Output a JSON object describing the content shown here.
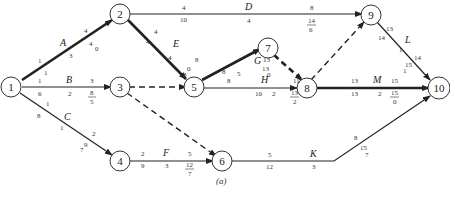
{
  "diagram": {
    "type": "activity-on-arrow network (CPM)",
    "caption": "(a)",
    "nodes": [
      {
        "id": "1",
        "label": "1"
      },
      {
        "id": "2",
        "label": "2"
      },
      {
        "id": "3",
        "label": "3"
      },
      {
        "id": "4",
        "label": "4"
      },
      {
        "id": "5",
        "label": "5"
      },
      {
        "id": "6",
        "label": "6"
      },
      {
        "id": "7",
        "label": "7"
      },
      {
        "id": "8",
        "label": "8"
      },
      {
        "id": "9",
        "label": "9"
      },
      {
        "id": "10",
        "label": "10"
      }
    ],
    "activities": [
      {
        "name": "A",
        "from": "1",
        "to": "2",
        "critical": true,
        "es": "1",
        "ls": "1",
        "dur": "3",
        "ef": "4",
        "tf_num": "4",
        "tf_den": "0"
      },
      {
        "name": "B",
        "from": "1",
        "to": "3",
        "critical": false,
        "es": "1",
        "ls": "6",
        "dur": "2",
        "ef": "3",
        "tf_num": "8",
        "tf_den": "5"
      },
      {
        "name": "C",
        "from": "1",
        "to": "4",
        "critical": false,
        "es": "1",
        "ls": "8",
        "dur": "1",
        "ef": "2",
        "tf_num": "9",
        "tf_den": "7"
      },
      {
        "name": "D",
        "from": "2",
        "to": "9",
        "critical": false,
        "es": "4",
        "ls": "10",
        "dur": "4",
        "ef": "8",
        "tf_num": "14",
        "tf_den": "6"
      },
      {
        "name": "E",
        "from": "2",
        "to": "5",
        "critical": true,
        "es": "4",
        "ls": "4",
        "dur": "4",
        "ef": "8",
        "tf_num": "8",
        "tf_den": "0"
      },
      {
        "name": "F",
        "from": "4",
        "to": "6",
        "critical": false,
        "es": "2",
        "ls": "9",
        "dur": "3",
        "ef": "5",
        "tf_num": "12",
        "tf_den": "7"
      },
      {
        "name": "G",
        "from": "5",
        "to": "7",
        "critical": true,
        "es": "8",
        "ls": "8",
        "dur": "5",
        "ef": "13",
        "tf_num": "13",
        "tf_den": "0"
      },
      {
        "name": "H",
        "from": "5",
        "to": "8",
        "critical": false,
        "es": "8",
        "ls": "10",
        "dur": "2",
        "ef": "11",
        "tf_num": "13",
        "tf_den": "2"
      },
      {
        "name": "K",
        "from": "6",
        "to": "10",
        "critical": false,
        "es": "5",
        "ls": "12",
        "dur": "3",
        "ef": "8",
        "tf_num": "15",
        "tf_den": "7"
      },
      {
        "name": "L",
        "from": "9",
        "to": "10",
        "critical": false,
        "es": "13",
        "ls": "14",
        "dur": "1",
        "ef": "14",
        "tf_num": "15",
        "tf_den": "1"
      },
      {
        "name": "M",
        "from": "8",
        "to": "10",
        "critical": true,
        "es": "13",
        "ls": "13",
        "dur": "2",
        "ef": "15",
        "tf_num": "15",
        "tf_den": "0"
      }
    ],
    "dummies": [
      {
        "from": "3",
        "to": "5",
        "critical": false
      },
      {
        "from": "3",
        "to": "6",
        "critical": false
      },
      {
        "from": "7",
        "to": "8",
        "critical": true
      },
      {
        "from": "8",
        "to": "9",
        "critical": false
      }
    ]
  }
}
